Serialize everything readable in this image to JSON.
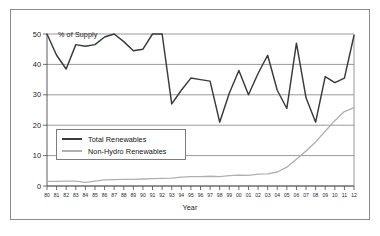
{
  "figure": {
    "y_axis_title": "% of Supply",
    "x_axis_title": "Year"
  },
  "legend": {
    "position": "inside-lower-left",
    "items": [
      {
        "label": "Total Renewables",
        "color": "#3a3a3a",
        "swatch": "line-swatch-dark"
      },
      {
        "label": "Non-Hydro Renewables",
        "color": "#b0b0b0",
        "swatch": "line-swatch-light"
      }
    ]
  },
  "chart_data": {
    "type": "line",
    "title": "",
    "subtitle": "",
    "xlabel": "Year",
    "ylabel": "% of Supply",
    "xlim": [
      0,
      32
    ],
    "ylim": [
      0,
      50
    ],
    "yticks": [
      0,
      10,
      20,
      30,
      40,
      50
    ],
    "ytick_labels": [
      "0",
      "10",
      "20",
      "30",
      "40",
      "50"
    ],
    "grid": "horizontal",
    "categories": [
      "80",
      "81",
      "82",
      "83",
      "84",
      "85",
      "86",
      "87",
      "88",
      "89",
      "90",
      "91",
      "92",
      "93",
      "94",
      "95",
      "96",
      "97",
      "98",
      "99",
      "00",
      "01",
      "02",
      "03",
      "04",
      "05",
      "06",
      "07",
      "08",
      "09",
      "10",
      "11",
      "12"
    ],
    "series": [
      {
        "name": "Total Renewables",
        "color": "#3a3a3a",
        "values": [
          50,
          43,
          38.5,
          46.5,
          46,
          46.5,
          49,
          50,
          47.5,
          44.5,
          45,
          50,
          50,
          27,
          31.5,
          35.5,
          35,
          34.5,
          21,
          30.5,
          38,
          30,
          37,
          43,
          31.5,
          25.5,
          47,
          29,
          21,
          36,
          34,
          35.5,
          49.5
        ]
      },
      {
        "name": "Non-Hydro Renewables",
        "color": "#b0b0b0",
        "values": [
          1.5,
          1.5,
          1.6,
          1.6,
          1.2,
          1.6,
          2.0,
          2.1,
          2.2,
          2.2,
          2.3,
          2.4,
          2.5,
          2.6,
          2.9,
          3.1,
          3.1,
          3.2,
          3.1,
          3.4,
          3.6,
          3.5,
          3.9,
          4.0,
          4.6,
          6.2,
          8.8,
          11.5,
          14.5,
          18.0,
          21.5,
          24.5,
          25.8
        ]
      }
    ]
  }
}
